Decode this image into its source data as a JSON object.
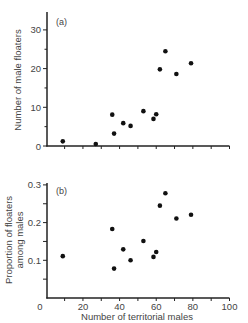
{
  "figure": {
    "xlabel": "Number of territorial males"
  },
  "chart_data": [
    {
      "type": "scatter",
      "panel_label": "(a)",
      "title": "",
      "xlabel": "",
      "ylabel": "Number of male floaters",
      "xlim": [
        0,
        100
      ],
      "ylim": [
        0,
        33
      ],
      "xticks": [
        0,
        10,
        20,
        30,
        40,
        50,
        60,
        70,
        80,
        90,
        100
      ],
      "yticks": [
        0,
        10,
        20,
        30
      ],
      "ytick_labels": [
        "0",
        "10",
        "20",
        "30"
      ],
      "grid": false,
      "x": [
        9,
        27,
        36,
        37,
        42,
        46,
        53,
        58.5,
        60,
        62,
        65,
        71,
        79
      ],
      "y": [
        1.2,
        0.5,
        8.1,
        3.2,
        5.9,
        5.2,
        9.0,
        7.0,
        8.2,
        19.8,
        24.5,
        18.6,
        21.4
      ]
    },
    {
      "type": "scatter",
      "panel_label": "(b)",
      "title": "",
      "xlabel": "Number of territorial males",
      "ylabel": "Proportion of floaters among males",
      "ylabel_lines": [
        "Proportion of floaters",
        "among males"
      ],
      "xlim": [
        0,
        100
      ],
      "ylim": [
        0,
        0.3
      ],
      "xticks": [
        0,
        10,
        20,
        30,
        40,
        50,
        60,
        70,
        80,
        90,
        100
      ],
      "xtick_labels": [
        "0",
        "20",
        "40",
        "60",
        "80",
        "100"
      ],
      "yticks": [
        0.05,
        0.1,
        0.15,
        0.2,
        0.25,
        0.3
      ],
      "ytick_labels": [
        "0.1",
        "0.2",
        "0.3"
      ],
      "grid": false,
      "x": [
        9,
        36,
        37,
        42,
        46,
        53,
        58.5,
        60,
        62,
        65,
        71,
        79
      ],
      "y": [
        0.111,
        0.183,
        0.078,
        0.129,
        0.1,
        0.151,
        0.109,
        0.122,
        0.245,
        0.278,
        0.211,
        0.221
      ]
    }
  ]
}
